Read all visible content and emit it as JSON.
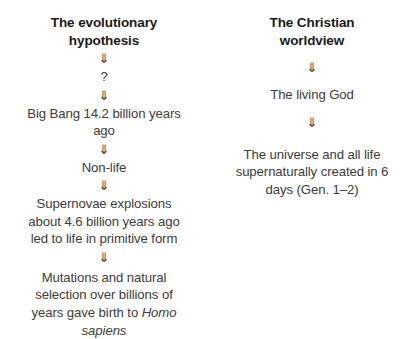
{
  "diagram": {
    "type": "two-column-flowchart",
    "background_color": "#ffffff",
    "header_color": "#1a1a1a",
    "body_text_color": "#3c3c3c",
    "arrow_glyph": "⇓",
    "arrow_icon_name": "down-double-arrow-icon",
    "columns": [
      {
        "id": "evolutionary",
        "header": "The evolutionary\nhypothesis",
        "nodes": [
          {
            "id": "question",
            "text": "?"
          },
          {
            "id": "big-bang",
            "text": "Big Bang 14.2 billion years\nago"
          },
          {
            "id": "non-life",
            "text": "Non-life"
          },
          {
            "id": "supernovae",
            "text": "Supernovae explosions\nabout 4.6 billion years ago\nled to life in primitive form"
          },
          {
            "id": "mutations",
            "text_plain": "Mutations and natural selection over billions of years gave birth to Homo sapiens",
            "text_before_italic": "Mutations and natural\nselection over billions of\nyears gave birth to ",
            "text_italic": "Homo\nsapiens"
          }
        ]
      },
      {
        "id": "christian",
        "header": "The Christian\nworldview",
        "nodes": [
          {
            "id": "living-god",
            "text": "The living God"
          },
          {
            "id": "universe",
            "text": "The universe and all life\nsupernaturally created in 6\ndays (Gen. 1–2)"
          }
        ]
      }
    ]
  }
}
